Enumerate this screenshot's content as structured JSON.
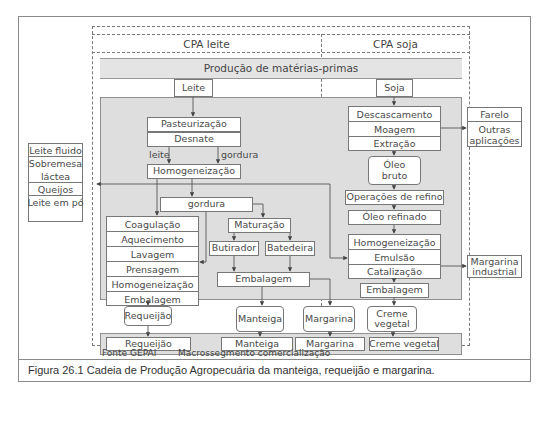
{
  "columns": {
    "left": "CPA leite",
    "right": "CPA soja"
  },
  "band_title": "Produção de matérias-primas",
  "inputs": {
    "leite": "Leite",
    "soja": "Soja"
  },
  "dairy": {
    "pasteurizacao": "Pasteurização",
    "desnate": "Desnate",
    "branch_leite": "leite",
    "branch_gordura": "gordura",
    "homogeneizacao": "Homogeneização",
    "gordura": "gordura",
    "requeijao_steps": [
      "Coagulação",
      "Aquecimento",
      "Lavagem",
      "Prensagem",
      "Homogeneização",
      "Embalagem"
    ],
    "maturacao": "Maturação",
    "butirador": "Butirador",
    "batedeira": "Batedeira",
    "embalagem": "Embalagem"
  },
  "side_left": [
    "Leite fluido",
    "Sobremesa láctea",
    "Queijos",
    "Leite em pó"
  ],
  "soy": {
    "extraction_steps": [
      "Descascamento",
      "Moagem",
      "Extração"
    ],
    "oleo_bruto": "Óleo bruto",
    "refino": "Operações de refino",
    "oleo_refinado": "Óleo refinado",
    "margarine_steps": [
      "Homogeneização",
      "Emulsão",
      "Catalização"
    ],
    "embalagem": "Embalagem"
  },
  "side_right": {
    "byproducts": [
      "Farelo",
      "Outras aplicações"
    ],
    "industrial": "Margarina industrial"
  },
  "products": [
    "Requeijão",
    "Manteiga",
    "Margarina",
    "Creme vegetal"
  ],
  "commercial": [
    "Requeijão",
    "Manteiga",
    "Margarina",
    "Creme vegetal"
  ],
  "footer": {
    "source": "Fonte GEPAI",
    "segment": "Macrossegmento comercialização"
  },
  "caption": "Figura 26.1 Cadeia de Produção Agropecuária da manteiga, requeijão e margarina."
}
